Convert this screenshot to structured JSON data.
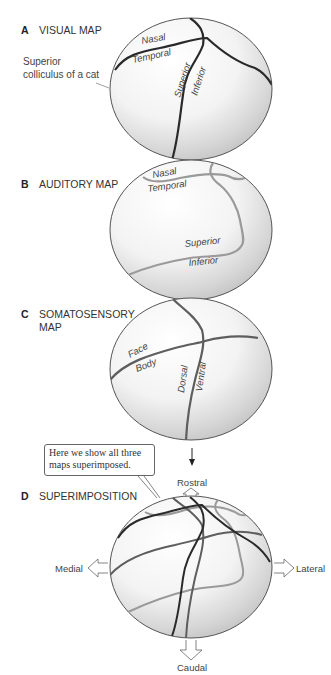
{
  "panels": {
    "a": {
      "letter": "A",
      "title": "VISUAL MAP",
      "side_label_1": "Superior",
      "side_label_2": "colliculus of a cat",
      "labels": {
        "nasal": "Nasal",
        "temporal": "Temporal",
        "superior": "Superior",
        "inferior": "Inferior"
      }
    },
    "b": {
      "letter": "B",
      "title": "AUDITORY MAP",
      "labels": {
        "nasal": "Nasal",
        "temporal": "Temporal",
        "superior": "Superior",
        "inferior": "Inferior"
      }
    },
    "c": {
      "letter": "C",
      "title_1": "SOMATOSENSORY",
      "title_2": "MAP",
      "labels": {
        "face": "Face",
        "body": "Body",
        "dorsal": "Dorsal",
        "ventral": "Ventral"
      }
    },
    "d": {
      "letter": "D",
      "title": "SUPERIMPOSITION",
      "callout_line_1": "Here we show all three",
      "callout_line_2": "maps superimposed.",
      "axes": {
        "rostral": "Rostral",
        "caudal": "Caudal",
        "medial": "Medial",
        "lateral": "Lateral"
      }
    }
  },
  "colors": {
    "visual_line": "#2a2a2a",
    "auditory_line": "#9a9a9a",
    "somatosensory_line": "#5e5e5e",
    "sphere_outline": "#555555"
  }
}
